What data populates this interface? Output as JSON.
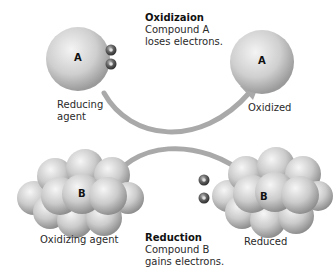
{
  "diagram": {
    "type": "redox-reaction",
    "colors": {
      "arrow": "#a9a9a9",
      "molecule_light": "#f2f2f2",
      "molecule_mid": "#c8c8c8",
      "molecule_dark": "#8e8e8e",
      "electron_dark": "#3a3a3a",
      "electron_light": "#9a9a9a",
      "text": "#2a2a2a"
    },
    "molecules": {
      "a_before": {
        "letter": "A",
        "label_line1": "Reducing",
        "label_line2": "agent"
      },
      "a_after": {
        "letter": "A",
        "label": "Oxidized"
      },
      "b_before": {
        "letter": "B",
        "label": "Oxidizing agent"
      },
      "b_after": {
        "letter": "B",
        "label": "Reduced"
      }
    },
    "electron_symbol": "e⁻",
    "captions": {
      "oxidation": {
        "title": "Oxidizaion",
        "line1": "Compound A",
        "line2": "loses electrons."
      },
      "reduction": {
        "title": "Reduction",
        "line1": "Compound B",
        "line2": "gains electrons."
      }
    }
  }
}
